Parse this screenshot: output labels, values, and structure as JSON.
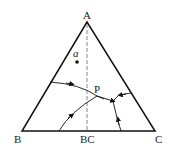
{
  "diagram": {
    "vertices": {
      "A": "A",
      "B": "B",
      "C": "C"
    },
    "labels": {
      "midpoint": "BC",
      "point_a": "a",
      "point_p": "P"
    },
    "colors": {
      "line": "#111111",
      "dashed": "#888888",
      "background": "#ffffff"
    }
  }
}
